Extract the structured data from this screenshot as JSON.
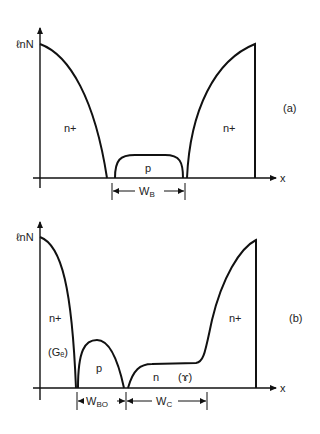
{
  "figure_a": {
    "y_axis_label": "ℓnN",
    "x_axis_label": "x",
    "panel_label": "(a)",
    "regions": {
      "left": "n+",
      "middle": "p",
      "right": "n+"
    },
    "width_label_main": "W",
    "width_label_sub": "B"
  },
  "figure_b": {
    "y_axis_label": "ℓnN",
    "x_axis_label": "x",
    "panel_label": "(b)",
    "regions": {
      "left": "n+",
      "left_note": "(Gₑ)",
      "middle": "p",
      "collector": "n",
      "collector_note": "(ɤ)",
      "right": "n+"
    },
    "width_label_1_main": "W",
    "width_label_1_sub": "BO",
    "width_label_2_main": "W",
    "width_label_2_sub": "C"
  }
}
